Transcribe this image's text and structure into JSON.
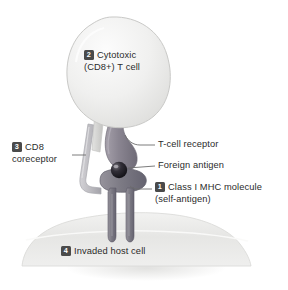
{
  "figure": {
    "background_color": "#ffffff"
  },
  "labels": {
    "tcell": {
      "number": "2",
      "line1": "Cytotoxic",
      "line2": "(CD8+) T cell"
    },
    "cd8": {
      "number": "3",
      "line1": "CD8",
      "line2": "coreceptor"
    },
    "tcr": {
      "line1": "T-cell receptor"
    },
    "antigen": {
      "line1": "Foreign antigen"
    },
    "mhc": {
      "number": "1",
      "line1": "Class I MHC molecule",
      "line2": "(self-antigen)"
    },
    "host": {
      "number": "4",
      "line1": "Invaded host cell"
    }
  },
  "colors": {
    "badge_background": "#4a4a4a",
    "badge_text": "#ffffff",
    "label_text": "#2b2b2b",
    "tcell_body": "#ededec",
    "tcell_outline": "#c9c9c7",
    "host_cell": "#e7e7e5",
    "host_membrane": "#f4f4f3",
    "tcr_protein": "#8f8a95",
    "mhc_protein": "#7e7c84",
    "cd8_protein": "#bdbcc0",
    "antigen_sphere": "#1c1a1f",
    "leader_line": "#6d6d6d",
    "shadow": "#e9e9e8"
  },
  "structures": [
    {
      "name": "cytotoxic-t-cell",
      "shape": "large irregular blob",
      "position": "top center"
    },
    {
      "name": "t-cell-receptor",
      "shape": "curved protein stalk",
      "position": "center"
    },
    {
      "name": "cd8-coreceptor",
      "shape": "thin hooked stalk",
      "position": "center left"
    },
    {
      "name": "foreign-antigen",
      "shape": "dark sphere",
      "position": "center"
    },
    {
      "name": "class-i-mhc-molecule",
      "shape": "two-legged protein",
      "position": "center"
    },
    {
      "name": "invaded-host-cell",
      "shape": "wide dome",
      "position": "bottom"
    }
  ]
}
